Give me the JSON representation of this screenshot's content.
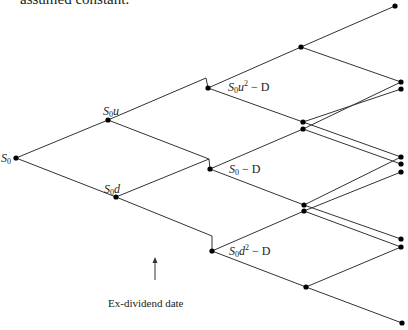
{
  "caption_top": "assumed constant.",
  "annotation": {
    "label": "Ex-dividend date",
    "arrow": {
      "x": 155,
      "y1": 280,
      "y2": 257
    }
  },
  "colors": {
    "line": "#333333",
    "node": "#000000",
    "background": "#ffffff"
  },
  "labels": {
    "s0": {
      "base": "S",
      "sub": "0",
      "rest": ""
    },
    "s0u": {
      "base": "S",
      "sub": "0",
      "rest": "u"
    },
    "s0d": {
      "base": "S",
      "sub": "0",
      "rest": "d"
    },
    "s0u2": {
      "base": "S",
      "sub": "0",
      "rest": "u",
      "sup": "2",
      "tail": " − D"
    },
    "s0mD": {
      "base": "S",
      "sub": "0",
      "rest": "",
      "tail": " − D"
    },
    "s0d2": {
      "base": "S",
      "sub": "0",
      "rest": "d",
      "sup": "2",
      "tail": " − D"
    }
  },
  "nodes": [
    {
      "id": "S0",
      "x": 16,
      "y": 158
    },
    {
      "id": "S0u",
      "x": 108,
      "y": 120
    },
    {
      "id": "S0d",
      "x": 116,
      "y": 197
    },
    {
      "id": "S0u2-D",
      "x": 208,
      "y": 88
    },
    {
      "id": "S0-D",
      "x": 210,
      "y": 169
    },
    {
      "id": "S0d2-D",
      "x": 212,
      "y": 251
    },
    {
      "id": "n3a",
      "x": 301,
      "y": 47
    },
    {
      "id": "n3b",
      "x": 303,
      "y": 122
    },
    {
      "id": "n3c",
      "x": 303,
      "y": 129
    },
    {
      "id": "n3d",
      "x": 304,
      "y": 205
    },
    {
      "id": "n3e",
      "x": 304,
      "y": 211
    },
    {
      "id": "n3f",
      "x": 306,
      "y": 287
    },
    {
      "id": "n4a",
      "x": 395,
      "y": 6
    },
    {
      "id": "n4b",
      "x": 401,
      "y": 82
    },
    {
      "id": "n4c",
      "x": 401,
      "y": 89
    },
    {
      "id": "n4d",
      "x": 401,
      "y": 157
    },
    {
      "id": "n4e",
      "x": 401,
      "y": 164
    },
    {
      "id": "n4f",
      "x": 401,
      "y": 172
    },
    {
      "id": "n4g",
      "x": 401,
      "y": 239
    },
    {
      "id": "n4h",
      "x": 401,
      "y": 247
    },
    {
      "id": "n4i",
      "x": 402,
      "y": 323
    }
  ],
  "edges": [
    [
      [
        16,
        158
      ],
      [
        108,
        120
      ]
    ],
    [
      [
        16,
        158
      ],
      [
        116,
        197
      ]
    ],
    [
      [
        108,
        120
      ],
      [
        206,
        78
      ],
      [
        208,
        88
      ]
    ],
    [
      [
        108,
        120
      ],
      [
        209,
        159
      ],
      [
        210,
        169
      ]
    ],
    [
      [
        116,
        197
      ],
      [
        209,
        159
      ]
    ],
    [
      [
        116,
        197
      ],
      [
        212,
        236
      ],
      [
        212,
        251
      ]
    ],
    [
      [
        208,
        88
      ],
      [
        301,
        47
      ]
    ],
    [
      [
        208,
        88
      ],
      [
        303,
        122
      ]
    ],
    [
      [
        210,
        169
      ],
      [
        303,
        129
      ]
    ],
    [
      [
        210,
        169
      ],
      [
        304,
        205
      ]
    ],
    [
      [
        212,
        251
      ],
      [
        304,
        211
      ]
    ],
    [
      [
        212,
        251
      ],
      [
        306,
        287
      ]
    ],
    [
      [
        301,
        47
      ],
      [
        395,
        6
      ]
    ],
    [
      [
        301,
        47
      ],
      [
        401,
        82
      ]
    ],
    [
      [
        303,
        122
      ],
      [
        401,
        89
      ]
    ],
    [
      [
        303,
        122
      ],
      [
        401,
        157
      ]
    ],
    [
      [
        303,
        129
      ],
      [
        401,
        82
      ]
    ],
    [
      [
        303,
        129
      ],
      [
        401,
        164
      ]
    ],
    [
      [
        304,
        205
      ],
      [
        401,
        157
      ]
    ],
    [
      [
        304,
        205
      ],
      [
        401,
        239
      ]
    ],
    [
      [
        304,
        211
      ],
      [
        401,
        172
      ]
    ],
    [
      [
        304,
        211
      ],
      [
        401,
        247
      ]
    ],
    [
      [
        306,
        287
      ],
      [
        401,
        247
      ]
    ],
    [
      [
        306,
        287
      ],
      [
        402,
        323
      ]
    ]
  ]
}
